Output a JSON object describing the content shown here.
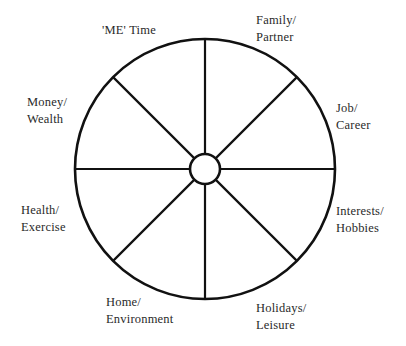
{
  "diagram": {
    "type": "wheel-of-life",
    "colors": {
      "background": "#ffffff",
      "stroke": "#111111",
      "text": "#2a2a2a"
    },
    "geometry": {
      "center": [
        205,
        169
      ],
      "outer_radius": 130,
      "inner_radius": 15,
      "spokes": 8
    },
    "segments": [
      {
        "id": "me-time",
        "line1": "'ME' Time",
        "line2": ""
      },
      {
        "id": "family-partner",
        "line1": "Family/",
        "line2": "Partner"
      },
      {
        "id": "job-career",
        "line1": "Job/",
        "line2": "Career"
      },
      {
        "id": "interests-hobbies",
        "line1": "Interests/",
        "line2": "Hobbies"
      },
      {
        "id": "holidays-leisure",
        "line1": "Holidays/",
        "line2": "Leisure"
      },
      {
        "id": "home-environment",
        "line1": "Home/",
        "line2": "Environment"
      },
      {
        "id": "health-exercise",
        "line1": "Health/",
        "line2": "Exercise"
      },
      {
        "id": "money-wealth",
        "line1": "Money/",
        "line2": "Wealth"
      }
    ]
  }
}
